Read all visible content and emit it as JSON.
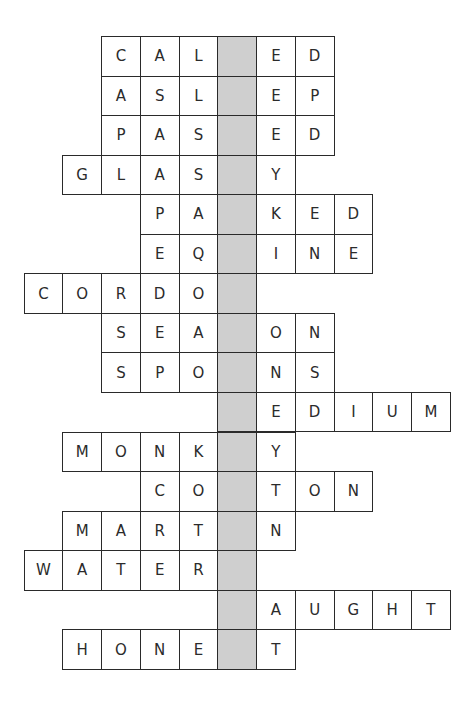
{
  "puzzle": {
    "grid": {
      "cols": 11,
      "rows": 16,
      "origin_x": 23.5,
      "origin_y": 36,
      "cell_w": 38.75,
      "cell_h": 39.55,
      "shaded_col": 5,
      "shaded_color": "#cfcfcf"
    },
    "words": [
      {
        "row": 0,
        "left": {
          "start": 2,
          "letters": "CAL"
        },
        "right": {
          "start": 6,
          "letters": "ED"
        }
      },
      {
        "row": 1,
        "left": {
          "start": 2,
          "letters": "ASL"
        },
        "right": {
          "start": 6,
          "letters": "EP"
        }
      },
      {
        "row": 2,
        "left": {
          "start": 2,
          "letters": "PAS"
        },
        "right": {
          "start": 6,
          "letters": "ED"
        }
      },
      {
        "row": 3,
        "left": {
          "start": 1,
          "letters": "GLAS"
        },
        "right": {
          "start": 6,
          "letters": "Y"
        }
      },
      {
        "row": 4,
        "left": {
          "start": 3,
          "letters": "PA"
        },
        "right": {
          "start": 6,
          "letters": "KED"
        }
      },
      {
        "row": 5,
        "left": {
          "start": 3,
          "letters": "EQ"
        },
        "right": {
          "start": 6,
          "letters": "INE"
        }
      },
      {
        "row": 6,
        "left": {
          "start": 0,
          "letters": "CORDO"
        },
        "right": {
          "start": 6,
          "letters": ""
        }
      },
      {
        "row": 7,
        "left": {
          "start": 2,
          "letters": "SEA"
        },
        "right": {
          "start": 6,
          "letters": "ON"
        }
      },
      {
        "row": 8,
        "left": {
          "start": 2,
          "letters": "SPO"
        },
        "right": {
          "start": 6,
          "letters": "NS"
        }
      },
      {
        "row": 9,
        "left": {
          "start": 5,
          "letters": ""
        },
        "right": {
          "start": 6,
          "letters": "EDIUM"
        }
      },
      {
        "row": 10,
        "left": {
          "start": 1,
          "letters": "MONK"
        },
        "right": {
          "start": 6,
          "letters": "Y"
        }
      },
      {
        "row": 11,
        "left": {
          "start": 3,
          "letters": "CO"
        },
        "right": {
          "start": 6,
          "letters": "TON"
        }
      },
      {
        "row": 12,
        "left": {
          "start": 1,
          "letters": "MART"
        },
        "right": {
          "start": 6,
          "letters": "N"
        }
      },
      {
        "row": 13,
        "left": {
          "start": 0,
          "letters": "WATER"
        },
        "right": {
          "start": 6,
          "letters": ""
        }
      },
      {
        "row": 14,
        "left": {
          "start": 5,
          "letters": ""
        },
        "right": {
          "start": 6,
          "letters": "AUGHT"
        }
      },
      {
        "row": 15,
        "left": {
          "start": 1,
          "letters": "HONE"
        },
        "right": {
          "start": 6,
          "letters": "T"
        }
      }
    ]
  }
}
